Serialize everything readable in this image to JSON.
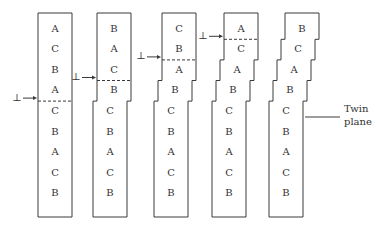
{
  "diagram": {
    "dislocation_symbol": "⊥",
    "crystals": [
      {
        "stage": 1,
        "sequence": [
          "A",
          "C",
          "B",
          "A",
          "C",
          "B",
          "A",
          "C",
          "B"
        ],
        "glide_plane_after_row": 4,
        "steps": 0
      },
      {
        "stage": 2,
        "sequence": [
          "B",
          "A",
          "C",
          "B",
          "C",
          "B",
          "A",
          "C",
          "B"
        ],
        "glide_plane_after_row": 3,
        "steps": 1
      },
      {
        "stage": 3,
        "sequence": [
          "C",
          "B",
          "A",
          "B",
          "C",
          "B",
          "A",
          "C",
          "B"
        ],
        "glide_plane_after_row": 2,
        "steps": 2
      },
      {
        "stage": 4,
        "sequence": [
          "A",
          "C",
          "A",
          "B",
          "C",
          "B",
          "A",
          "C",
          "B"
        ],
        "glide_plane_after_row": 1,
        "steps": 3
      },
      {
        "stage": 5,
        "sequence": [
          "B",
          "C",
          "A",
          "B",
          "C",
          "B",
          "A",
          "C",
          "B"
        ],
        "glide_plane_after_row": null,
        "steps": 4
      }
    ],
    "twin_label": [
      "Twin",
      "plane"
    ]
  }
}
